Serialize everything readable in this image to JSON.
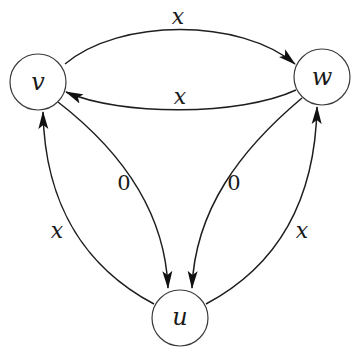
{
  "diagram": {
    "type": "directed-weighted-graph",
    "nodes": [
      {
        "id": "v",
        "label": "v"
      },
      {
        "id": "w",
        "label": "w"
      },
      {
        "id": "u",
        "label": "u"
      }
    ],
    "edges": [
      {
        "from": "v",
        "to": "w",
        "label": "x"
      },
      {
        "from": "w",
        "to": "v",
        "label": "x"
      },
      {
        "from": "v",
        "to": "u",
        "label": "0"
      },
      {
        "from": "w",
        "to": "u",
        "label": "0"
      },
      {
        "from": "u",
        "to": "v",
        "label": "x"
      },
      {
        "from": "u",
        "to": "w",
        "label": "x"
      }
    ],
    "colors": {
      "stroke": "#1e1e1e",
      "node_border": "#3a3a3a",
      "background": "#ffffff"
    }
  }
}
